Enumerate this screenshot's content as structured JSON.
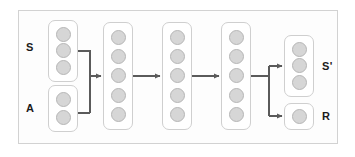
{
  "diagram": {
    "type": "neural-network-architecture",
    "title": "",
    "background_color": "#ffffff",
    "frame_border_color": "#d2d2d2",
    "node_fill_color": "#d6d6d6",
    "node_border_color": "#b6b6b6",
    "group_border_color": "#cfcfcf",
    "wire_color": "#5a5a5a",
    "labels": {
      "state_input": "S",
      "action_input": "A",
      "next_state_output": "S'",
      "reward_output": "R"
    },
    "layers": [
      {
        "id": "input-state",
        "label": "S",
        "node_count": 3,
        "role": "input"
      },
      {
        "id": "input-action",
        "label": "A",
        "node_count": 2,
        "role": "input"
      },
      {
        "id": "hidden-1",
        "label": "",
        "node_count": 5,
        "role": "hidden"
      },
      {
        "id": "hidden-2",
        "label": "",
        "node_count": 5,
        "role": "hidden"
      },
      {
        "id": "hidden-3",
        "label": "",
        "node_count": 5,
        "role": "hidden"
      },
      {
        "id": "output-state",
        "label": "S'",
        "node_count": 3,
        "role": "output"
      },
      {
        "id": "output-reward",
        "label": "R",
        "node_count": 1,
        "role": "output"
      }
    ],
    "connections": [
      {
        "from": "input-state",
        "to": "hidden-1",
        "style": "merge"
      },
      {
        "from": "input-action",
        "to": "hidden-1",
        "style": "merge"
      },
      {
        "from": "hidden-1",
        "to": "hidden-2",
        "style": "arrow"
      },
      {
        "from": "hidden-2",
        "to": "hidden-3",
        "style": "arrow"
      },
      {
        "from": "hidden-3",
        "to": "output-state",
        "style": "split"
      },
      {
        "from": "hidden-3",
        "to": "output-reward",
        "style": "split"
      }
    ]
  }
}
